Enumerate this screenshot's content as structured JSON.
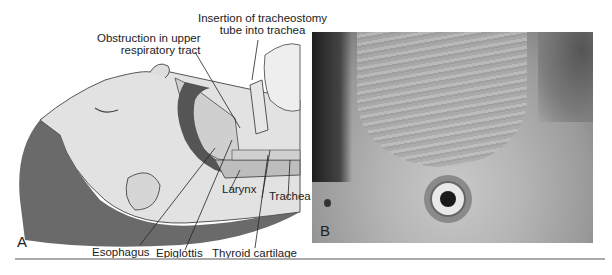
{
  "figure": {
    "panel_a": {
      "letter": "A",
      "labels": {
        "insertion": [
          "Insertion of tracheostomy",
          "tube into trachea"
        ],
        "obstruction": [
          "Obstruction in upper",
          "respiratory tract"
        ],
        "larynx": "Larynx",
        "trachea": "Trachea",
        "esophagus": "Esophagus",
        "epiglottis": "Epiglottis",
        "thyroid_cartilage": "Thyroid cartilage"
      }
    },
    "panel_b": {
      "letter": "B"
    }
  }
}
